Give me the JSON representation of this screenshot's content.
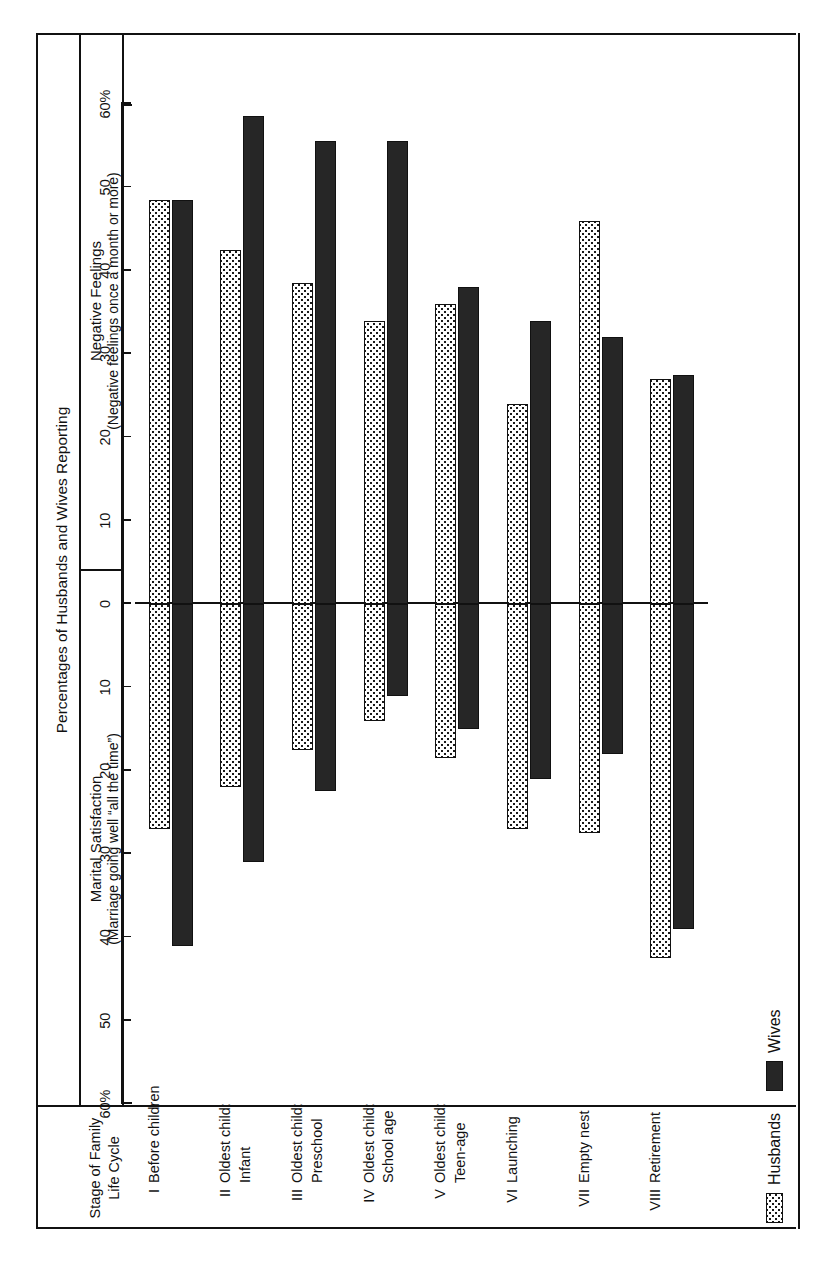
{
  "figure": {
    "spanning_header": "Percentages of Husbands and Wives Reporting",
    "stage_column_header": "Stage of Family Life Cycle",
    "panels": [
      {
        "title": "Marital Satisfaction",
        "subtitle": "(Marriage going well “all the time”)"
      },
      {
        "title": "Negative Feelings",
        "subtitle": "(Negative feelings once a month or more)"
      }
    ],
    "axis_tick_labels_left": [
      "60%",
      "50",
      "40",
      "30",
      "20",
      "10",
      "0"
    ],
    "axis_tick_labels_right": [
      "10",
      "20",
      "30",
      "40",
      "50",
      "60%"
    ],
    "legend": [
      {
        "key": "husbands",
        "label": "Husbands",
        "pattern": "dotted-fill",
        "color": "#ffffff"
      },
      {
        "key": "wives",
        "label": "Wives",
        "pattern": "solid-fill",
        "color": "#262626"
      }
    ]
  },
  "chart_data": {
    "type": "bar",
    "title": "Percentages of Husbands and Wives Reporting",
    "orientation": "bidirectional-horizontal",
    "grid": false,
    "legend_position": "bottom-left",
    "xlabel": "",
    "ylabel": "Stage of Family Life Cycle",
    "axis": {
      "left_panel": {
        "name": "Marital Satisfaction",
        "note": "(Marriage going well “all the time”)",
        "range": [
          0,
          60
        ],
        "ticks": [
          0,
          10,
          20,
          30,
          40,
          50,
          60
        ],
        "direction": "left"
      },
      "right_panel": {
        "name": "Negative Feelings",
        "note": "(Negative feelings once a month or more)",
        "range": [
          0,
          60
        ],
        "ticks": [
          0,
          10,
          20,
          30,
          40,
          50,
          60
        ],
        "direction": "right"
      },
      "units": "percent"
    },
    "categories": [
      {
        "numeral": "I",
        "label": "Before children"
      },
      {
        "numeral": "II",
        "label": "Oldest child:\nInfant"
      },
      {
        "numeral": "III",
        "label": "Oldest child:\nPreschool"
      },
      {
        "numeral": "IV",
        "label": "Oldest child:\nSchool age"
      },
      {
        "numeral": "V",
        "label": "Oldest child:\nTeen-age"
      },
      {
        "numeral": "VI",
        "label": "Launching"
      },
      {
        "numeral": "VII",
        "label": "Empty nest"
      },
      {
        "numeral": "VIII",
        "label": "Retirement"
      }
    ],
    "series": [
      {
        "name": "Husbands",
        "marital_satisfaction": [
          27,
          22,
          17.5,
          14,
          18.5,
          27,
          27.5,
          42.5
        ],
        "negative_feelings": [
          48.5,
          42.5,
          38.5,
          34,
          36,
          24,
          46,
          27
        ]
      },
      {
        "name": "Wives",
        "marital_satisfaction": [
          41,
          31,
          22.5,
          11,
          15,
          21,
          18,
          39
        ],
        "negative_feelings": [
          48.5,
          58.5,
          55.5,
          55.5,
          38,
          34,
          32,
          27.5
        ]
      }
    ]
  }
}
